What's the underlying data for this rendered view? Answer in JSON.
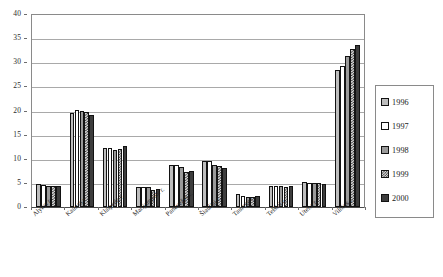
{
  "chart_data": {
    "type": "bar",
    "title": "",
    "subtitle": "",
    "xlabel": "",
    "ylabel": "",
    "ylim": [
      0,
      40
    ],
    "ytick_labels": [
      "40",
      "35",
      "30",
      "25",
      "20",
      "15",
      "10",
      "5",
      "0"
    ],
    "ytick_values": [
      40,
      35,
      30,
      25,
      20,
      15,
      10,
      5,
      0
    ],
    "grid": true,
    "legend_position": "right",
    "categories": [
      "Alytus r.",
      "Kaunas r.",
      "Klaipėda r.",
      "Marijampolė r.",
      "Panevėžys r.",
      "Šiauliai r.",
      "Tauragė r.",
      "Telšiai r.",
      "Utena r.",
      "Vilnius r."
    ],
    "series": [
      {
        "name": "1996",
        "color": "#bdbdbd",
        "pattern": "solid-light-gray",
        "values": [
          4.7,
          19.5,
          12.3,
          4.2,
          8.8,
          9.6,
          2.6,
          4.4,
          5.1,
          28.4
        ]
      },
      {
        "name": "1997",
        "color": "#ffffff",
        "pattern": "solid-white",
        "values": [
          4.6,
          20.2,
          12.2,
          4.2,
          8.8,
          9.5,
          2.3,
          4.3,
          5.0,
          29.3
        ]
      },
      {
        "name": "1998",
        "color": "#9a9a9a",
        "pattern": "solid-medium-gray",
        "values": [
          4.4,
          19.9,
          11.9,
          4.1,
          8.3,
          8.7,
          2.1,
          4.3,
          4.9,
          31.3
        ]
      },
      {
        "name": "1999",
        "color": "#d8d8d8",
        "pattern": "checkered",
        "values": [
          4.4,
          19.6,
          12.0,
          3.5,
          7.2,
          8.4,
          2.0,
          4.2,
          4.9,
          32.8
        ]
      },
      {
        "name": "2000",
        "color": "#3d3d3d",
        "pattern": "solid-dark-gray",
        "values": [
          4.3,
          19.1,
          12.6,
          3.8,
          7.5,
          8.0,
          2.3,
          4.3,
          4.7,
          33.5
        ]
      }
    ]
  },
  "legend": {
    "items": [
      {
        "label": "1996"
      },
      {
        "label": "1997"
      },
      {
        "label": "1998"
      },
      {
        "label": "1999"
      },
      {
        "label": "2000"
      }
    ]
  }
}
